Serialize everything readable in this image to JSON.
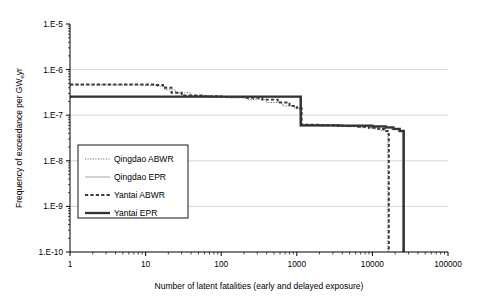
{
  "chart_data": {
    "type": "line",
    "title": "",
    "xlabel": "Number of latent fatalities (early and delayed exposure)",
    "ylabel_main": "Frequency of exceedance per GW",
    "ylabel_sub": "e",
    "ylabel_tail": "yr",
    "xscale": "log",
    "yscale": "log",
    "xlim": [
      1,
      100000
    ],
    "ylim": [
      1e-10,
      1e-05
    ],
    "grid": "horizontal-major",
    "legend_position": "inner-left",
    "xticks": [
      "1",
      "10",
      "100",
      "1000",
      "10000",
      "100000"
    ],
    "xtick_values": [
      1,
      10,
      100,
      1000,
      10000,
      100000
    ],
    "yticks": [
      "1.E-5",
      "1.E-6",
      "1.E-7",
      "1.E-8",
      "1.E-9",
      "1.E-10"
    ],
    "ytick_values": [
      1e-05,
      1e-06,
      1e-07,
      1e-08,
      1e-09,
      1e-10
    ],
    "series": [
      {
        "name": "Qingdao ABWR",
        "style": "fine-dotted",
        "color": "#555555",
        "points": [
          [
            1,
            4.6e-07
          ],
          [
            6,
            4.6e-07
          ],
          [
            10,
            4.5e-07
          ],
          [
            14,
            4.3e-07
          ],
          [
            18,
            3.6e-07
          ],
          [
            25,
            3.1e-07
          ],
          [
            40,
            2.7e-07
          ],
          [
            70,
            2.5e-07
          ],
          [
            120,
            2.4e-07
          ],
          [
            220,
            2.2e-07
          ],
          [
            400,
            1.9e-07
          ],
          [
            650,
            1.6e-07
          ],
          [
            900,
            1.45e-07
          ],
          [
            1100,
            1.4e-07
          ],
          [
            1150,
            6.3e-08
          ],
          [
            1600,
            6.1e-08
          ],
          [
            2600,
            5.9e-08
          ],
          [
            4500,
            5.6e-08
          ],
          [
            7000,
            5.3e-08
          ],
          [
            10000,
            5e-08
          ],
          [
            13000,
            4.6e-08
          ],
          [
            15000,
            4.3e-08
          ],
          [
            16000,
            1e-10
          ]
        ]
      },
      {
        "name": "Qingdao EPR",
        "style": "thin-solid",
        "color": "#9a9a9a",
        "points": [
          [
            1,
            2.5e-07
          ],
          [
            100,
            2.5e-07
          ],
          [
            600,
            2.5e-07
          ],
          [
            1050,
            2.5e-07
          ],
          [
            1100,
            5.8e-08
          ],
          [
            3000,
            5.7e-08
          ],
          [
            9000,
            5.5e-08
          ],
          [
            14000,
            5.2e-08
          ],
          [
            18000,
            4.8e-08
          ],
          [
            22000,
            4.4e-08
          ],
          [
            25000,
            1e-10
          ]
        ]
      },
      {
        "name": "Yantai ABWR",
        "style": "dashed",
        "color": "#3a3a3a",
        "points": [
          [
            1,
            4.7e-07
          ],
          [
            8,
            4.7e-07
          ],
          [
            13,
            4.6e-07
          ],
          [
            17,
            4e-07
          ],
          [
            22,
            3.1e-07
          ],
          [
            30,
            2.7e-07
          ],
          [
            55,
            2.6e-07
          ],
          [
            100,
            2.5e-07
          ],
          [
            200,
            2.4e-07
          ],
          [
            350,
            2.2e-07
          ],
          [
            560,
            1.9e-07
          ],
          [
            800,
            1.6e-07
          ],
          [
            1000,
            1.45e-07
          ],
          [
            1100,
            1.4e-07
          ],
          [
            1160,
            6.2e-08
          ],
          [
            2000,
            6e-08
          ],
          [
            3500,
            5.8e-08
          ],
          [
            6000,
            5.6e-08
          ],
          [
            9000,
            5.3e-08
          ],
          [
            12000,
            5e-08
          ],
          [
            14500,
            4.5e-08
          ],
          [
            16500,
            1e-10
          ]
        ]
      },
      {
        "name": "Yantai EPR",
        "style": "thick-solid",
        "color": "#333333",
        "points": [
          [
            1,
            2.55e-07
          ],
          [
            500,
            2.55e-07
          ],
          [
            1000,
            2.55e-07
          ],
          [
            1080,
            2.55e-07
          ],
          [
            1130,
            6e-08
          ],
          [
            4000,
            5.9e-08
          ],
          [
            10000,
            5.7e-08
          ],
          [
            15000,
            5.4e-08
          ],
          [
            19000,
            5e-08
          ],
          [
            23000,
            4.5e-08
          ],
          [
            26000,
            1e-10
          ]
        ]
      }
    ]
  },
  "legend": {
    "items": [
      {
        "label": "Qingdao ABWR",
        "style": "fine-dotted"
      },
      {
        "label": "Qingdao EPR",
        "style": "thin-solid"
      },
      {
        "label": "Yantai ABWR",
        "style": "dashed"
      },
      {
        "label": "Yantai EPR",
        "style": "thick-solid"
      }
    ]
  }
}
